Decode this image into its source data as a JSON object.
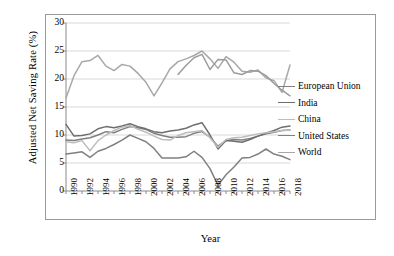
{
  "chart_data": {
    "type": "line",
    "title": "",
    "xlabel": "Year",
    "ylabel": "Adjusted Net Saving Rate (%)",
    "xlim": [
      1990,
      2018
    ],
    "ylim": [
      0,
      30
    ],
    "ytick_values": [
      0,
      5,
      10,
      15,
      20,
      25,
      30
    ],
    "xtick_labels": [
      "1990",
      "1992",
      "1994",
      "1996",
      "1998",
      "2000",
      "2002",
      "2004",
      "2006",
      "2008",
      "2010",
      "2012",
      "2014",
      "2016",
      "2018"
    ],
    "x": [
      1990,
      1991,
      1992,
      1993,
      1994,
      1995,
      1996,
      1997,
      1998,
      1999,
      2000,
      2001,
      2002,
      2003,
      2004,
      2005,
      2006,
      2007,
      2008,
      2009,
      2010,
      2011,
      2012,
      2013,
      2014,
      2015,
      2016,
      2017,
      2018
    ],
    "grid": "horizontal",
    "legend_position": "right",
    "series": [
      {
        "name": "European Union",
        "color": "#7f7f7f",
        "values": [
          9.1,
          9.0,
          9.3,
          9.5,
          10.0,
          10.6,
          10.4,
          11.0,
          11.5,
          11.3,
          11.0,
          10.3,
          9.9,
          9.6,
          9.6,
          9.7,
          10.3,
          10.6,
          9.6,
          8.0,
          9.0,
          9.2,
          9.1,
          9.4,
          9.8,
          10.2,
          10.5,
          10.8,
          10.9
        ]
      },
      {
        "name": "India",
        "color": "#6e6e6e",
        "values": [
          11.9,
          9.8,
          9.9,
          10.2,
          11.1,
          11.5,
          11.3,
          11.6,
          12.0,
          11.5,
          11.1,
          10.6,
          10.4,
          10.7,
          10.9,
          11.2,
          11.8,
          12.2,
          10.0,
          7.5,
          9.0,
          8.9,
          8.7,
          9.2,
          9.8,
          10.3,
          10.8,
          11.4,
          11.6
        ]
      },
      {
        "name": "China",
        "color": "#bdbdbd",
        "values": [
          8.8,
          8.6,
          9.0,
          7.2,
          9.0,
          10.0,
          10.8,
          11.4,
          11.7,
          11.0,
          10.5,
          9.8,
          9.2,
          9.1,
          9.9,
          10.4,
          10.6,
          10.8,
          9.5,
          7.8,
          9.2,
          9.5,
          9.6,
          9.9,
          10.2,
          10.4,
          10.6,
          10.8,
          10.9
        ]
      },
      {
        "name": "United States",
        "color": "#808080",
        "values": [
          6.6,
          6.8,
          7.0,
          6.0,
          7.1,
          7.6,
          8.3,
          9.1,
          10.0,
          9.4,
          8.8,
          7.6,
          5.9,
          5.9,
          5.9,
          6.1,
          7.1,
          6.0,
          4.0,
          1.0,
          2.9,
          4.3,
          5.9,
          6.0,
          6.6,
          7.5,
          6.6,
          6.2,
          5.6
        ]
      },
      {
        "name": "World",
        "color": "#a8a8a8",
        "values": [
          16.6,
          20.6,
          23.1,
          23.3,
          24.2,
          22.3,
          21.5,
          22.6,
          22.3,
          21.0,
          19.4,
          17.0,
          19.3,
          21.8,
          23.1,
          23.6,
          24.2,
          25.0,
          23.6,
          21.9,
          24.0,
          23.0,
          21.4,
          21.2,
          21.6,
          20.2,
          19.7,
          17.6,
          22.5
        ]
      },
      {
        "name": "World-secondary",
        "color": "#9c9c9c",
        "values": [
          null,
          null,
          null,
          null,
          null,
          null,
          null,
          null,
          null,
          null,
          null,
          null,
          null,
          null,
          20.8,
          22.4,
          23.8,
          24.4,
          21.7,
          23.5,
          23.4,
          21.1,
          20.8,
          21.5,
          21.4,
          20.6,
          19.2,
          18.0,
          17.0
        ]
      }
    ]
  },
  "legend": {
    "items": [
      {
        "label": "European Union",
        "color": "#7f7f7f"
      },
      {
        "label": "India",
        "color": "#6e6e6e"
      },
      {
        "label": "China",
        "color": "#bdbdbd"
      },
      {
        "label": "United States",
        "color": "#808080"
      },
      {
        "label": "World",
        "color": "#a8a8a8"
      }
    ]
  }
}
